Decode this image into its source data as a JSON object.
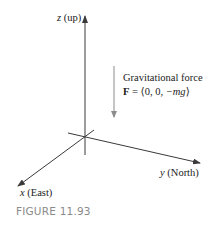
{
  "figure": {
    "caption": "FIGURE 11.93",
    "colors": {
      "axis": "#3a3a3a",
      "force_arrow": "#8c8c8c",
      "caption": "#8a8a8a",
      "text": "#222222"
    }
  },
  "axes": {
    "z": {
      "var": "z",
      "desc": "(up)"
    },
    "y": {
      "var": "y",
      "desc": "(North)"
    },
    "x": {
      "var": "x",
      "desc": "(East)"
    }
  },
  "force": {
    "title": "Gravitational force",
    "vector_symbol": "F",
    "equals": " = ⟨0, 0, ",
    "component": "−mg",
    "close": "⟩"
  }
}
